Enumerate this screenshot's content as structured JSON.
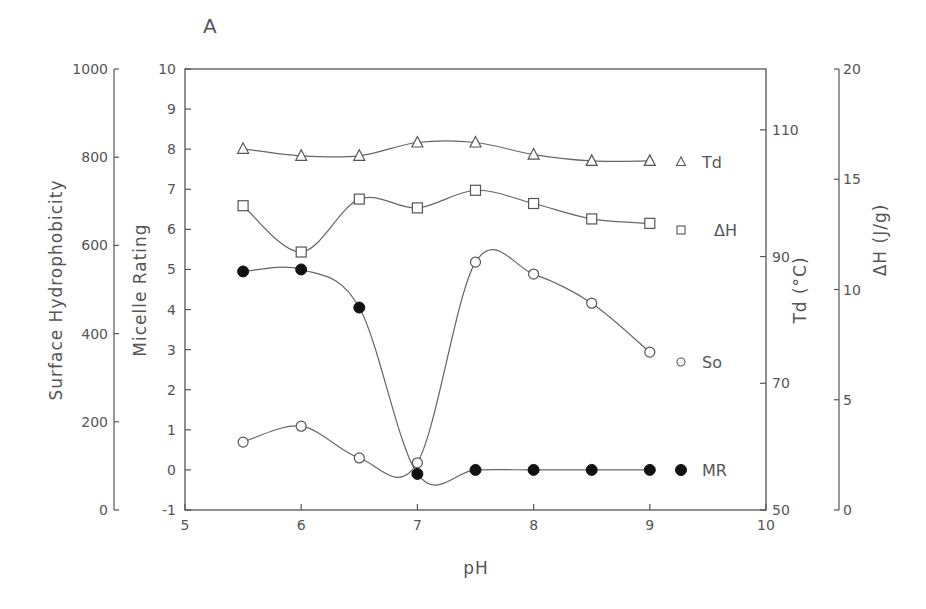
{
  "chart_data": {
    "type": "line",
    "panel_label": "A",
    "title": "",
    "xlabel": "pH",
    "x_ticks": [
      5,
      6,
      7,
      8,
      9,
      10
    ],
    "xlim": [
      5,
      10
    ],
    "axes": {
      "surface_hydrophobicity": {
        "label": "Surface Hydrophobicity",
        "ticks": [
          0,
          200,
          400,
          600,
          800,
          1000
        ],
        "range": [
          0,
          1000
        ],
        "position": "far-left"
      },
      "micelle_rating": {
        "label": "Micelle Rating",
        "ticks": [
          -1,
          0,
          1,
          2,
          3,
          4,
          5,
          6,
          7,
          8,
          9,
          10
        ],
        "range": [
          -1,
          10
        ],
        "position": "left"
      },
      "td": {
        "label": "Td (°C)",
        "ticks": [
          50,
          70,
          90,
          110
        ],
        "range": [
          50,
          119.6
        ],
        "position": "right"
      },
      "delta_h": {
        "label": "ΔH (J/g)",
        "ticks": [
          0,
          5,
          10,
          15,
          20
        ],
        "range": [
          0,
          20
        ],
        "position": "far-right"
      }
    },
    "x": [
      5.5,
      6.0,
      6.5,
      7.0,
      7.5,
      8.0,
      8.5,
      9.0
    ],
    "series": [
      {
        "name": "Td",
        "axis": "td",
        "marker": "open-triangle",
        "values": [
          107.0,
          105.9,
          105.9,
          108.0,
          108.0,
          106.1,
          105.1,
          105.1
        ]
      },
      {
        "name": "ΔH",
        "axis": "delta_h",
        "marker": "open-square",
        "values": [
          13.8,
          11.7,
          14.1,
          13.7,
          14.5,
          13.9,
          13.2,
          13.0
        ]
      },
      {
        "name": "So",
        "axis": "surface_hydrophobicity",
        "marker": "open-circle",
        "values": [
          154,
          190,
          118,
          107,
          562,
          535,
          469,
          358
        ]
      },
      {
        "name": "MR",
        "axis": "micelle_rating",
        "marker": "filled-circle",
        "values": [
          4.95,
          5.0,
          4.05,
          -0.1,
          0.0,
          0.0,
          0.0,
          0.0
        ]
      }
    ],
    "legend": [
      {
        "marker": "open-triangle",
        "label": "Td"
      },
      {
        "marker": "open-square",
        "label": "ΔH"
      },
      {
        "marker": "open-circle",
        "label": "So"
      },
      {
        "marker": "filled-circle",
        "label": "MR"
      }
    ],
    "legend_position": "inside-right",
    "grid": false
  }
}
